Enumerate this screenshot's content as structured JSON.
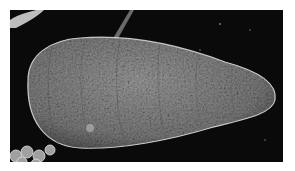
{
  "image": {
    "description": "Scanning electron micrograph of an elongated, tapered, segmented larva-like organism with a textured surface on a black background",
    "background_color": "#0a0a0a",
    "border_color": "#ffffff",
    "subject_color": "#8a8a8a",
    "highlight_color": "#e0e0e0"
  }
}
